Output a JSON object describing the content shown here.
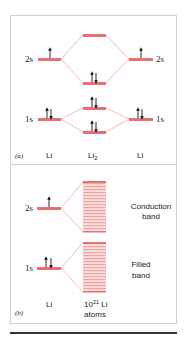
{
  "colors": {
    "level": "#e8706f",
    "band_line": "#f0a3a0",
    "band_fill": "#fbe0de",
    "connector": "#f0a8a4",
    "arrow": "#111111",
    "border": "#cfcfcf",
    "rule": "#333333"
  },
  "panel_a": {
    "tag": "(a)",
    "labels": {
      "left": "Li",
      "center_base": "Li",
      "center_sub": "2",
      "right": "Li"
    },
    "level_labels": {
      "left_2s": "2s",
      "right_2s": "2s",
      "left_1s": "1s",
      "right_1s": "1s"
    },
    "levels": [
      {
        "name": "li-left-2s",
        "electrons": "up"
      },
      {
        "name": "li-right-2s",
        "electrons": "up"
      },
      {
        "name": "li2-sigma-2s-antibonding",
        "electrons": "none"
      },
      {
        "name": "li2-sigma-2s-bonding",
        "electrons": "up-down"
      },
      {
        "name": "li2-sigma-1s-antibonding",
        "electrons": "up-down"
      },
      {
        "name": "li2-sigma-1s-bonding",
        "electrons": "up-down"
      },
      {
        "name": "li-left-1s",
        "electrons": "up-down"
      },
      {
        "name": "li-right-1s",
        "electrons": "up-down"
      }
    ]
  },
  "panel_b": {
    "tag": "(b)",
    "labels": {
      "left": "Li",
      "center_base": "10",
      "center_sup": "21",
      "center_suffix": " Li",
      "center_line2": "atoms"
    },
    "level_labels": {
      "2s": "2s",
      "1s": "1s"
    },
    "bands": {
      "conduction_line1": "Conduction",
      "conduction_line2": "band",
      "filled_line1": "Filled",
      "filled_line2": "band"
    }
  }
}
